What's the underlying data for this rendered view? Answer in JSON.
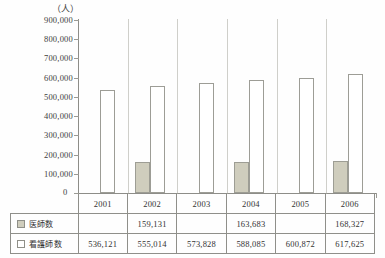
{
  "chart_data": {
    "type": "bar",
    "title": "",
    "subtitle": "",
    "unit_label": "（人）",
    "xlabel": "",
    "ylabel": "",
    "ylim": [
      0,
      900000
    ],
    "ytick_step": 100000,
    "grid": false,
    "legend_position": "table-left",
    "categories": [
      "2001",
      "2002",
      "2003",
      "2004",
      "2005",
      "2006"
    ],
    "ytick_labels": [
      "900,000",
      "800,000",
      "700,000",
      "600,000",
      "500,000",
      "400,000",
      "300,000",
      "200,000",
      "100,000",
      "0"
    ],
    "ytick_values": [
      900000,
      800000,
      700000,
      600000,
      500000,
      400000,
      300000,
      200000,
      100000,
      0
    ],
    "series": [
      {
        "name": "医師数",
        "color": "#cfcdbd",
        "values": [
          null,
          159131,
          null,
          163683,
          null,
          168327
        ],
        "labels": [
          "",
          "159,131",
          "",
          "163,683",
          "",
          "168,327"
        ]
      },
      {
        "name": "看護師数",
        "color": "#ffffff",
        "values": [
          536121,
          555014,
          573828,
          588085,
          600872,
          617625
        ],
        "labels": [
          "536,121",
          "555,014",
          "573,828",
          "588,085",
          "600,872",
          "617,625"
        ]
      }
    ]
  },
  "axis": {
    "zero_label": "0"
  },
  "table": {
    "header": [
      "",
      "2001",
      "2002",
      "2003",
      "2004",
      "2005",
      "2006"
    ],
    "rows": [
      {
        "legend_label": "医師数",
        "swatch": "doctor-swatch",
        "cells": [
          "",
          "159,131",
          "",
          "163,683",
          "",
          "168,327"
        ]
      },
      {
        "legend_label": "看護師数",
        "swatch": "nurse-swatch",
        "cells": [
          "536,121",
          "555,014",
          "573,828",
          "588,085",
          "600,872",
          "617,625"
        ]
      }
    ]
  },
  "colors": {
    "doctor_bar": "#cfcdbd",
    "nurse_bar": "#ffffff",
    "axis": "#8d8d88",
    "grid_separator": "#cfcfca",
    "text": "#3b3b3b"
  }
}
